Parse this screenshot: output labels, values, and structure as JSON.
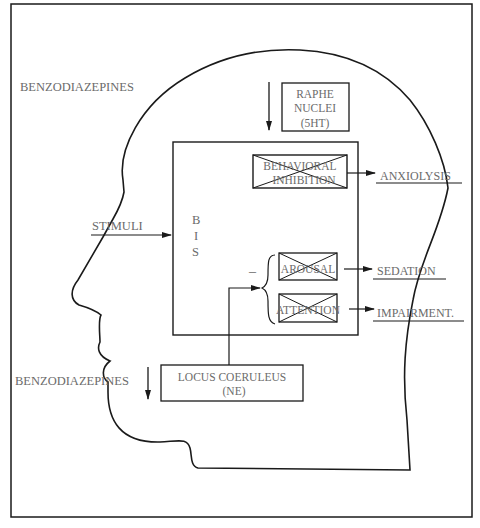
{
  "diagram": {
    "labels": {
      "benzodiazepines_top": "BENZODIAZEPINES",
      "benzodiazepines_bottom": "BENZODIAZEPINES",
      "stimuli": "STIMULI",
      "bis": [
        "B",
        "I",
        "S"
      ],
      "raphe": [
        "RAPHE",
        "NUCLEI",
        "(5HT)"
      ],
      "behavioral_inhibition": [
        "BEHAVIORAL",
        "INHIBITION"
      ],
      "arousal": "AROUSAL",
      "attention": "ATTENTION",
      "minus_sign": "–",
      "locus_coeruleus": [
        "LOCUS COERULEUS",
        "(NE)"
      ],
      "anxiolysis": "ANXIOLYSIS",
      "sedation": "SEDATION",
      "impairment": "IMPAIRMENT."
    },
    "nodes": [
      {
        "id": "raphe",
        "text": "RAPHE NUCLEI (5HT)"
      },
      {
        "id": "bis",
        "text": "BIS"
      },
      {
        "id": "behavioral-inhibition",
        "text": "BEHAVIORAL INHIBITION",
        "crossed_out": true
      },
      {
        "id": "arousal",
        "text": "AROUSAL",
        "crossed_out": true
      },
      {
        "id": "attention",
        "text": "ATTENTION",
        "crossed_out": true
      },
      {
        "id": "locus-coeruleus",
        "text": "LOCUS COERULEUS (NE)"
      }
    ],
    "edges": [
      {
        "from": "STIMULI",
        "to": "bis"
      },
      {
        "from": "BENZODIAZEPINES",
        "to": "raphe",
        "style": "arrow-down"
      },
      {
        "from": "BENZODIAZEPINES",
        "to": "locus-coeruleus",
        "style": "arrow-down"
      },
      {
        "from": "locus-coeruleus",
        "to": "arousal/attention",
        "sign": "–"
      },
      {
        "from": "behavioral-inhibition",
        "to": "ANXIOLYSIS"
      },
      {
        "from": "arousal",
        "to": "SEDATION"
      },
      {
        "from": "attention",
        "to": "IMPAIRMENT."
      }
    ]
  }
}
